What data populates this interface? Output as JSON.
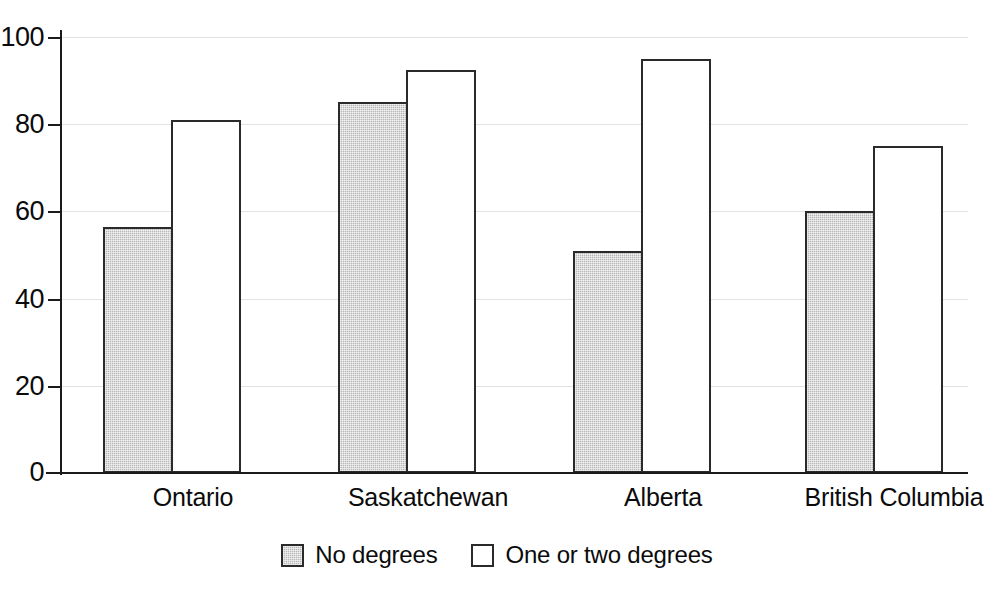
{
  "chart_data": {
    "type": "bar",
    "title": "",
    "subtitle": "",
    "xlabel": "",
    "ylabel": "",
    "categories": [
      "Ontario",
      "Saskatchewan",
      "Alberta",
      "British Columbia"
    ],
    "series": [
      {
        "name": "No degrees",
        "values": [
          56.5,
          85,
          51,
          60
        ],
        "fill": "#b9b9b9",
        "pattern": "shaded"
      },
      {
        "name": "One or two degrees",
        "values": [
          81,
          92.5,
          95,
          75
        ],
        "fill": "#ffffff",
        "pattern": "hollow"
      }
    ],
    "ylim": [
      0,
      100
    ],
    "yticks": [
      0,
      20,
      40,
      60,
      80,
      100
    ],
    "ytick_labels": [
      "0",
      "20",
      "40",
      "60",
      "80",
      "100"
    ],
    "grid": true,
    "grid_axis": "y",
    "grid_color": "#e2e2e2",
    "legend_position": "bottom-center",
    "axis_color": "#1b1b1b",
    "bar_border_color": "#2a2a2a",
    "background": "#ffffff"
  },
  "legend": {
    "items": [
      {
        "label": "No degrees",
        "swatch": "shaded-swatch-icon"
      },
      {
        "label": "One or two degrees",
        "swatch": "hollow-swatch-icon"
      }
    ]
  }
}
